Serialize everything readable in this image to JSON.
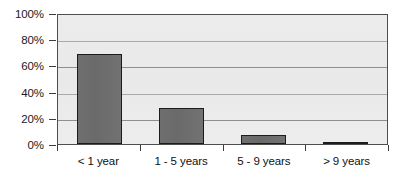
{
  "chart_data": {
    "type": "bar",
    "title": "",
    "subtitle": "",
    "xlabel": "",
    "ylabel": "",
    "categories": [
      "< 1 year",
      "1 - 5 years",
      "5 - 9 years",
      "> 9 years"
    ],
    "values": [
      70,
      28,
      7,
      1.5
    ],
    "series": [
      {
        "name": "",
        "values": [
          70,
          28,
          7,
          1.5
        ]
      }
    ],
    "ylim": [
      0,
      100
    ],
    "ytick_values": [
      0,
      20,
      40,
      60,
      80,
      100
    ],
    "ytick_labels": [
      "0%",
      "20%",
      "40%",
      "60%",
      "80%",
      "100%"
    ],
    "value_format": "percent",
    "grid": true,
    "grid_axis": "y",
    "legend": false,
    "legend_position": "none",
    "bar_color": "#6b6b6b",
    "bar_edge_color": "#1c1c1c",
    "plot_background": "#ebebeb",
    "frame_color": "#4f4f4f",
    "gridline_color": "#a9a9a9",
    "text_color": "#111111"
  }
}
